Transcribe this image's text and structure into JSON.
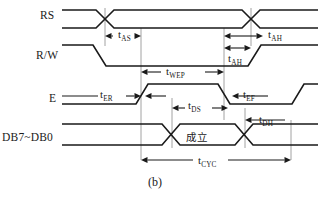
{
  "figure": {
    "caption": "(b)",
    "caption_x": 148,
    "caption_y": 175
  },
  "signals": [
    {
      "name": "RS",
      "label": "RS",
      "label_x": 40,
      "label_y": 9,
      "top": 10,
      "bottom": 28
    },
    {
      "name": "R/W",
      "label": "R/W",
      "label_x": 36,
      "label_y": 49,
      "top": 45,
      "bottom": 66
    },
    {
      "name": "E",
      "label": "E",
      "label_x": 49,
      "label_y": 92,
      "top": 84,
      "bottom": 104
    },
    {
      "name": "DB7~DB0",
      "label": "DB7~DB0",
      "label_x": 2,
      "label_y": 131,
      "top": 124,
      "bottom": 145
    }
  ],
  "timing_labels": [
    {
      "name": "t-as",
      "base": "t",
      "sub": "AS",
      "x": 118,
      "y": 29
    },
    {
      "name": "t-ah-top",
      "base": "t",
      "sub": "AH",
      "x": 268,
      "y": 29
    },
    {
      "name": "t-ah-rw",
      "base": "t",
      "sub": "AH",
      "x": 228,
      "y": 53
    },
    {
      "name": "t-wep",
      "base": "t",
      "sub": "WEP",
      "x": 166,
      "y": 66
    },
    {
      "name": "t-er",
      "base": "t",
      "sub": "ER",
      "x": 100,
      "y": 89
    },
    {
      "name": "t-ef",
      "base": "t",
      "sub": "EF",
      "x": 243,
      "y": 89
    },
    {
      "name": "t-ds",
      "base": "t",
      "sub": "DS",
      "x": 188,
      "y": 100
    },
    {
      "name": "t-dh",
      "base": "t",
      "sub": "DH",
      "x": 259,
      "y": 114
    },
    {
      "name": "t-cyc",
      "base": "t",
      "sub": "CYC",
      "x": 198,
      "y": 155
    }
  ],
  "data_field": {
    "text": "成立",
    "x": 186,
    "y": 129
  },
  "colors": {
    "wave": "#1a1a1a",
    "guide": "#8a8a8a",
    "background": "#ffffff"
  },
  "geometry": {
    "rs": {
      "left_cross": 105,
      "right_cross": 251,
      "cross_half": 9,
      "start_x": 62,
      "end_x": 318
    },
    "rw": {
      "fall_start": 93,
      "fall_end": 106,
      "rise_start": 248,
      "rise_end": 261,
      "start_x": 62,
      "end_x": 318
    },
    "e": {
      "rise1_start": 136,
      "rise1_end": 148,
      "fall1_start": 218,
      "fall1_end": 230,
      "rise2_start": 292,
      "rise2_end": 304,
      "start_x": 62,
      "end_x": 318
    },
    "db": {
      "left_cross": 171,
      "right_cross": 244,
      "cross_half": 9,
      "start_x": 62,
      "end_x": 318
    },
    "guides": [
      {
        "name": "guide-rs-left",
        "x": 105,
        "y1": 8,
        "y2": 46
      },
      {
        "name": "guide-e-rise",
        "x": 141,
        "y1": 28,
        "y2": 160
      },
      {
        "name": "guide-ds-start",
        "x": 172,
        "y1": 98,
        "y2": 148
      },
      {
        "name": "guide-e-fall",
        "x": 224,
        "y1": 28,
        "y2": 120
      },
      {
        "name": "guide-dh",
        "x": 245,
        "y1": 108,
        "y2": 148
      },
      {
        "name": "guide-rs-right",
        "x": 251,
        "y1": 8,
        "y2": 46
      },
      {
        "name": "guide-cyc-end",
        "x": 291,
        "y1": 120,
        "y2": 160
      }
    ],
    "dimensions": [
      {
        "name": "dim-tas",
        "y": 36,
        "x1": 105,
        "x2": 141,
        "arrow_left": true,
        "arrow_right": true,
        "label_gap": [
          113,
          141
        ]
      },
      {
        "name": "dim-ah-top",
        "y": 36,
        "x1": 224,
        "x2": 263,
        "arrow_left": true,
        "arrow_right": true,
        "label_gap": [
          263,
          263
        ]
      },
      {
        "name": "dim-ah-rw",
        "y": 48,
        "x1": 224,
        "x2": 251,
        "arrow_left": true,
        "arrow_right": true,
        "label_gap": [
          224,
          224
        ]
      },
      {
        "name": "dim-twep",
        "y": 72,
        "x1": 141,
        "x2": 224,
        "arrow_left": true,
        "arrow_right": true,
        "label_gap": [
          161,
          205
        ]
      },
      {
        "name": "dim-ter",
        "y": 96,
        "x1": 62,
        "x2": 141,
        "arrow_left": false,
        "arrow_right": true,
        "label_gap": [
          98,
          126
        ]
      },
      {
        "name": "dim-tef",
        "y": 96,
        "x1": 232,
        "x2": 268,
        "arrow_left": true,
        "arrow_right": false,
        "label_gap": [
          232,
          232
        ]
      },
      {
        "name": "dim-ter2",
        "y": 96,
        "x1": 145,
        "x2": 166,
        "arrow_left": true,
        "arrow_right": false,
        "label_gap": [
          145,
          145
        ]
      },
      {
        "name": "dim-tds",
        "y": 108,
        "x1": 172,
        "x2": 228,
        "arrow_left": true,
        "arrow_right": true,
        "label_gap": [
          185,
          212
        ]
      },
      {
        "name": "dim-tdh",
        "y": 120,
        "x1": 245,
        "x2": 285,
        "arrow_left": true,
        "arrow_right": false,
        "label_gap": [
          245,
          245
        ]
      },
      {
        "name": "dim-tcyc",
        "y": 160,
        "x1": 141,
        "x2": 291,
        "arrow_left": true,
        "arrow_right": true,
        "label_gap": [
          193,
          228
        ]
      }
    ]
  }
}
